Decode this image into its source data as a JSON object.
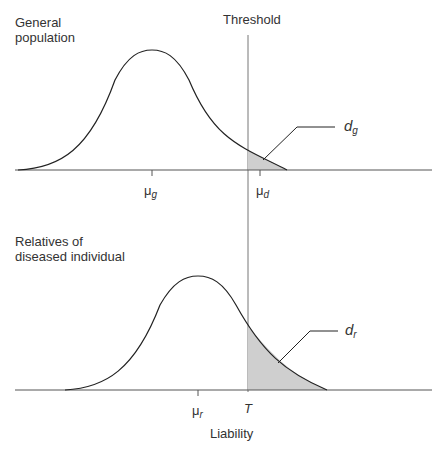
{
  "top_panel": {
    "title_line1": "General",
    "title_line2": "population",
    "threshold_label": "Threshold",
    "mean_label": "μ",
    "mean_sub": "g",
    "affected_mean_label": "μ",
    "affected_mean_sub": "d",
    "area_label": "d",
    "area_sub": "g"
  },
  "bottom_panel": {
    "title_line1": "Relatives of",
    "title_line2": "diseased individual",
    "mean_label": "μ",
    "mean_sub": "r",
    "threshold_label": "T",
    "area_label": "d",
    "area_sub": "r",
    "x_axis_label": "Liability"
  },
  "colors": {
    "line": "#222222",
    "shade": "#cfcfcf",
    "threshold": "#777777"
  }
}
